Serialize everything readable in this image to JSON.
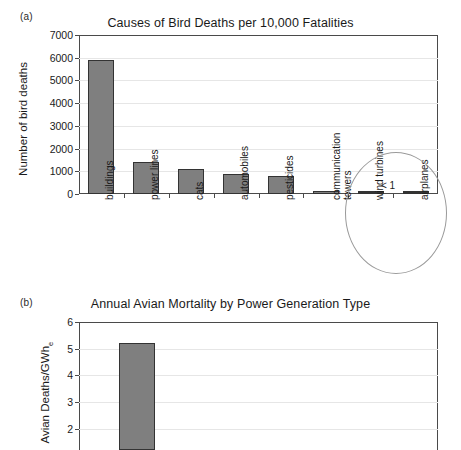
{
  "figure": {
    "panel_a_label": "(a)",
    "panel_b_label": "(b)"
  },
  "chart_data": [
    {
      "type": "bar",
      "panel": "(a)",
      "title": "Causes of Bird Deaths per 10,000 Fatalities",
      "xlabel": "",
      "ylabel": "Number of bird deaths",
      "ylim": [
        0,
        7000
      ],
      "ytick_labels": [
        "7000",
        "6000",
        "5000",
        "4000",
        "3000",
        "2000",
        "1000",
        "0"
      ],
      "yticks": [
        7000,
        6000,
        5000,
        4000,
        3000,
        2000,
        1000,
        0
      ],
      "grid": true,
      "legend": "none",
      "categories": [
        "buildings",
        "power lines",
        "cats",
        "automobiles",
        "pesticides",
        "communication towers",
        "wind turbines",
        "airplanes"
      ],
      "values": [
        5900,
        1400,
        1100,
        900,
        800,
        100,
        0.5,
        0.5
      ],
      "annotations": [
        {
          "text": "< 1",
          "target": [
            "wind turbines",
            "airplanes"
          ],
          "shape": "ellipse"
        }
      ]
    },
    {
      "type": "bar",
      "panel": "(b)",
      "title": "Annual Avian Mortality by Power Generation Type",
      "xlabel": "",
      "ylabel": "Avian Deaths/GWh",
      "ylabel_subscript": "e",
      "ylim": [
        0,
        6
      ],
      "ytick_labels": [
        "6",
        "5",
        "4",
        "3",
        "2"
      ],
      "yticks": [
        6,
        5,
        4,
        3,
        2
      ],
      "grid": true,
      "legend": "none",
      "categories": [
        ""
      ],
      "values": [
        5.2
      ],
      "note": "bottom of panel is cropped by the image edge"
    }
  ]
}
